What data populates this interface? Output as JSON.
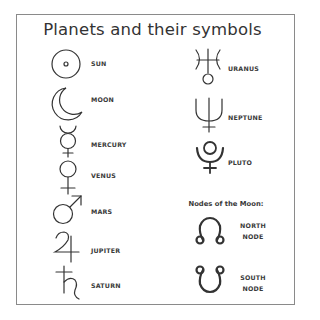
{
  "title": "Planets and their symbols",
  "left_column": [
    {
      "name": "SUN",
      "icon": "sun-icon"
    },
    {
      "name": "MOON",
      "icon": "moon-icon"
    },
    {
      "name": "MERCURY",
      "icon": "mercury-icon"
    },
    {
      "name": "VENUS",
      "icon": "venus-icon"
    },
    {
      "name": "MARS",
      "icon": "mars-icon"
    },
    {
      "name": "JUPITER",
      "icon": "jupiter-icon"
    },
    {
      "name": "SATURN",
      "icon": "saturn-icon"
    }
  ],
  "right_column": [
    {
      "name": "URANUS",
      "icon": "uranus-icon"
    },
    {
      "name": "NEPTUNE",
      "icon": "neptune-icon"
    },
    {
      "name": "PLUTO",
      "icon": "pluto-icon"
    }
  ],
  "nodes": {
    "heading": "Nodes of the Moon:",
    "items": [
      {
        "line1": "NORTH",
        "line2": "NODE",
        "icon": "north-node-icon"
      },
      {
        "line1": "SOUTH",
        "line2": "NODE",
        "icon": "south-node-icon"
      }
    ]
  },
  "colors": {
    "stroke": "#333333",
    "border": "#8a8a8a",
    "background": "#ffffff"
  }
}
